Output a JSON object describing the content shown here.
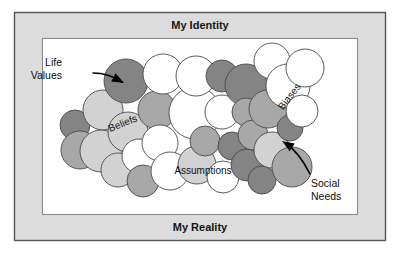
{
  "figure": {
    "title_top": "My Identity",
    "title_bottom": "My Reality",
    "colors": {
      "frame_fill": "#dcdcdc",
      "frame_stroke": "#555555",
      "inner_fill": "#ffffff",
      "inner_stroke": "#8a8a8a",
      "bubble_stroke": "#4a4a4a",
      "bubble_white": "#ffffff",
      "bubble_light": "#d2d2d2",
      "bubble_mid": "#a8a8a8",
      "bubble_dark": "#848484",
      "text": "#111111",
      "callout": "#000000"
    }
  },
  "bands": {
    "top": {
      "label": "My Identity"
    },
    "bottom": {
      "label": "My Reality"
    }
  },
  "cluster_labels": [
    {
      "id": "beliefs",
      "text": "Beliefs",
      "x": 123,
      "y": 124,
      "rotate": -22
    },
    {
      "id": "assumptions",
      "text": "Assumptions",
      "x": 203,
      "y": 171,
      "rotate": 0
    },
    {
      "id": "biases",
      "text": "Biases",
      "x": 290,
      "y": 97,
      "rotate": -52
    }
  ],
  "callouts": [
    {
      "id": "life-values",
      "line1": "Life",
      "line2": "Values",
      "text_x": 62,
      "text_y1": 63,
      "text_y2": 76,
      "path": "M 93 73 C 104 73 113 76 122 82",
      "head": "124,83 113,79 116,73",
      "head_rotate": 28,
      "head_cx": 124,
      "head_cy": 83
    },
    {
      "id": "social-needs",
      "line1": "Social",
      "line2": "Needs",
      "text_x": 311,
      "text_y1": 184,
      "text_y2": 197,
      "path": "M 310 174 C 303 160 296 150 285 143",
      "head": "282,141 294,142 290,148",
      "head_rotate": 212,
      "head_cx": 282,
      "head_cy": 141
    }
  ],
  "bubbles": [
    {
      "cx": 75,
      "cy": 125,
      "r": 15,
      "tone": "dark"
    },
    {
      "cx": 80,
      "cy": 150,
      "r": 19,
      "tone": "mid"
    },
    {
      "cx": 103,
      "cy": 110,
      "r": 20,
      "tone": "light"
    },
    {
      "cx": 101,
      "cy": 151,
      "r": 21,
      "tone": "light"
    },
    {
      "cx": 118,
      "cy": 170,
      "r": 17,
      "tone": "light"
    },
    {
      "cx": 126,
      "cy": 81,
      "r": 22,
      "tone": "dark"
    },
    {
      "cx": 128,
      "cy": 132,
      "r": 20,
      "tone": "light"
    },
    {
      "cx": 139,
      "cy": 156,
      "r": 17,
      "tone": "white"
    },
    {
      "cx": 143,
      "cy": 181,
      "r": 16,
      "tone": "mid"
    },
    {
      "cx": 157,
      "cy": 110,
      "r": 19,
      "tone": "mid"
    },
    {
      "cx": 160,
      "cy": 143,
      "r": 18,
      "tone": "white"
    },
    {
      "cx": 163,
      "cy": 74,
      "r": 20,
      "tone": "white"
    },
    {
      "cx": 170,
      "cy": 171,
      "r": 19,
      "tone": "white"
    },
    {
      "cx": 195,
      "cy": 113,
      "r": 26,
      "tone": "white"
    },
    {
      "cx": 196,
      "cy": 76,
      "r": 20,
      "tone": "white"
    },
    {
      "cx": 197,
      "cy": 165,
      "r": 19,
      "tone": "light"
    },
    {
      "cx": 205,
      "cy": 141,
      "r": 15,
      "tone": "mid"
    },
    {
      "cx": 222,
      "cy": 76,
      "r": 16,
      "tone": "dark"
    },
    {
      "cx": 222,
      "cy": 112,
      "r": 17,
      "tone": "white"
    },
    {
      "cx": 223,
      "cy": 177,
      "r": 16,
      "tone": "white"
    },
    {
      "cx": 232,
      "cy": 146,
      "r": 14,
      "tone": "dark"
    },
    {
      "cx": 246,
      "cy": 85,
      "r": 21,
      "tone": "dark"
    },
    {
      "cx": 246,
      "cy": 112,
      "r": 14,
      "tone": "mid"
    },
    {
      "cx": 247,
      "cy": 165,
      "r": 16,
      "tone": "dark"
    },
    {
      "cx": 253,
      "cy": 135,
      "r": 15,
      "tone": "mid"
    },
    {
      "cx": 262,
      "cy": 180,
      "r": 14,
      "tone": "dark"
    },
    {
      "cx": 268,
      "cy": 109,
      "r": 19,
      "tone": "mid"
    },
    {
      "cx": 272,
      "cy": 61,
      "r": 18,
      "tone": "white"
    },
    {
      "cx": 272,
      "cy": 150,
      "r": 18,
      "tone": "light"
    },
    {
      "cx": 288,
      "cy": 86,
      "r": 22,
      "tone": "white"
    },
    {
      "cx": 290,
      "cy": 128,
      "r": 13,
      "tone": "dark"
    },
    {
      "cx": 292,
      "cy": 167,
      "r": 20,
      "tone": "mid"
    },
    {
      "cx": 302,
      "cy": 111,
      "r": 16,
      "tone": "white"
    },
    {
      "cx": 305,
      "cy": 68,
      "r": 19,
      "tone": "white"
    }
  ]
}
